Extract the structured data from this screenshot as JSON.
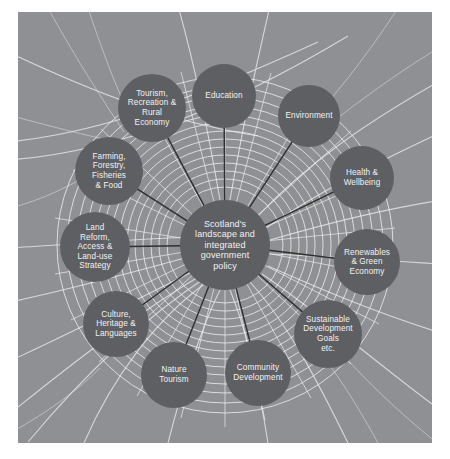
{
  "figure": {
    "background_color": "#8f9093",
    "node_color": "#5e5f63",
    "node_text_color": "#f2f2f2",
    "connector_color": "#2e2f31",
    "web_color": "#e8e8ea",
    "page_color": "#ffffff"
  },
  "center": {
    "label": "Scotland's\nlandscape and\nintegrated\ngovernment\npolicy",
    "cx": 207,
    "cy": 233,
    "r": 45
  },
  "nodes": [
    {
      "id": "education",
      "label": "Education",
      "cx": 206,
      "cy": 84,
      "r": 32
    },
    {
      "id": "environment",
      "label": "Environment",
      "cx": 291,
      "cy": 104,
      "r": 31
    },
    {
      "id": "health",
      "label": "Health &\nWellbeing",
      "cx": 344,
      "cy": 166,
      "r": 32
    },
    {
      "id": "renewables",
      "label": "Renewables\n& Green\nEconomy",
      "cx": 349,
      "cy": 250,
      "r": 33
    },
    {
      "id": "sdg",
      "label": "Sustainable\nDevelopment\nGoals\netc.",
      "cx": 310,
      "cy": 322,
      "r": 34
    },
    {
      "id": "community",
      "label": "Community\nDevelopment",
      "cx": 240,
      "cy": 361,
      "r": 33
    },
    {
      "id": "nature",
      "label": "Nature\nTourism",
      "cx": 156,
      "cy": 363,
      "r": 33
    },
    {
      "id": "culture",
      "label": "Culture,\nHeritage &\nLanguages",
      "cx": 98,
      "cy": 312,
      "r": 33
    },
    {
      "id": "land-reform",
      "label": "Land\nReform,\nAccess &\nLand-use\nStrategy",
      "cx": 77,
      "cy": 235,
      "r": 35
    },
    {
      "id": "farming",
      "label": "Farming,\nForestry,\nFisheries\n& Food",
      "cx": 91,
      "cy": 159,
      "r": 34
    },
    {
      "id": "tourism-rural",
      "label": "Tourism,\nRecreation &\nRural\nEconomy",
      "cx": 134,
      "cy": 96,
      "r": 34
    },
    {
      "id": "tourism-top",
      "label": "",
      "cx": 0,
      "cy": 0,
      "r": 0
    }
  ],
  "chart_data": {
    "type": "diagram",
    "subtype": "hub-and-spoke",
    "title": "Scotland's landscape and integrated government policy",
    "hub": "Scotland's landscape and integrated government policy",
    "spokes": [
      "Education",
      "Environment",
      "Health & Wellbeing",
      "Renewables & Green Economy",
      "Sustainable Development Goals etc.",
      "Community Development",
      "Nature Tourism",
      "Culture, Heritage & Languages",
      "Land Reform, Access & Land-use Strategy",
      "Farming, Forestry, Fisheries & Food",
      "Tourism, Recreation & Rural Economy"
    ],
    "spoke_count": 11,
    "background_motif": "spider web"
  }
}
